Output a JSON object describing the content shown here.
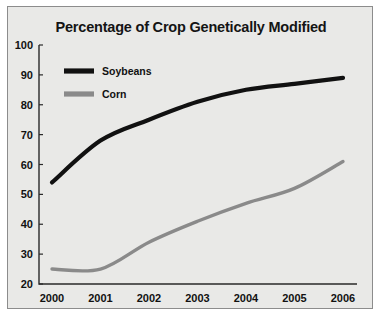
{
  "chart_data": {
    "type": "line",
    "title": "Percentage of Crop Genetically Modified",
    "xlabel": "",
    "ylabel": "",
    "x": [
      "2000",
      "2001",
      "2002",
      "2003",
      "2004",
      "2005",
      "2006"
    ],
    "categories": [
      "2000",
      "2001",
      "2002",
      "2003",
      "2004",
      "2005",
      "2006"
    ],
    "series": [
      {
        "name": "Soybeans",
        "color": "#111111",
        "values": [
          54,
          68,
          75,
          81,
          85,
          87,
          89
        ]
      },
      {
        "name": "Corn",
        "color": "#8a8a8a",
        "values": [
          25,
          25,
          34,
          41,
          47,
          52,
          61
        ]
      }
    ],
    "ylim": [
      20,
      100
    ],
    "yticks": [
      20,
      30,
      40,
      50,
      60,
      70,
      80,
      90,
      100
    ],
    "ytick_labels": [
      "20",
      "30",
      "40",
      "50",
      "60",
      "70",
      "80",
      "90",
      "100"
    ],
    "xtick_labels": [
      "2000",
      "2001",
      "2002",
      "2003",
      "2004",
      "2005",
      "2006"
    ],
    "grid": false,
    "legend_position": "top-left",
    "smoothing": "curved"
  },
  "figure": {
    "background_color": "#ffffff",
    "panel_color": "#e9e9e7",
    "border_color": "#8c8c8c",
    "axis_color": "#2a2a2a"
  },
  "legend": {
    "entries": [
      {
        "label": "Soybeans",
        "color": "#111111"
      },
      {
        "label": "Corn",
        "color": "#8a8a8a"
      }
    ]
  }
}
